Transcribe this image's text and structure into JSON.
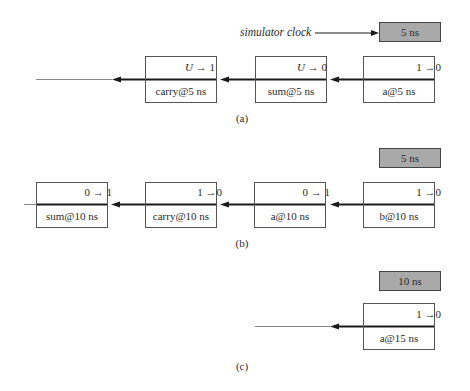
{
  "diagram": {
    "clock_label": "simulator clock",
    "panels": [
      {
        "caption": "(a)",
        "clock": "5 ns",
        "events": [
          {
            "name": "carry@5 ns",
            "from": "U",
            "to": "1",
            "from_italic": true
          },
          {
            "name": "sum@5 ns",
            "from": "U",
            "to": "0",
            "from_italic": true
          },
          {
            "name": "a@5 ns",
            "from": "1",
            "to": "0",
            "from_italic": false
          }
        ]
      },
      {
        "caption": "(b)",
        "clock": "5 ns",
        "events": [
          {
            "name": "sum@10 ns",
            "from": "0",
            "to": "1",
            "from_italic": false
          },
          {
            "name": "carry@10 ns",
            "from": "1",
            "to": "0",
            "from_italic": false
          },
          {
            "name": "a@10 ns",
            "from": "0",
            "to": "1",
            "from_italic": false
          },
          {
            "name": "b@10 ns",
            "from": "1",
            "to": "0",
            "from_italic": false
          }
        ]
      },
      {
        "caption": "(c)",
        "clock": "10 ns",
        "events": [
          {
            "name": "a@15 ns",
            "from": "1",
            "to": "0",
            "from_italic": false
          }
        ]
      }
    ],
    "arrow_glyph": "→",
    "colors": {
      "clock_fill": "#a9a9a9",
      "line": "#1a1a1a",
      "thin_line": "#888888",
      "box_border": "#555555"
    }
  }
}
